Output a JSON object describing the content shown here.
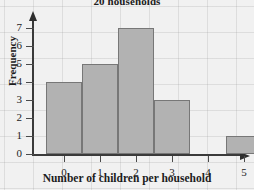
{
  "chart_data": {
    "type": "bar",
    "title": "20 households",
    "xlabel": "Number of children per household",
    "ylabel": "Frequency",
    "categories": [
      "0",
      "1",
      "2",
      "3",
      "4",
      "5"
    ],
    "values": [
      4,
      5,
      7,
      3,
      0,
      1
    ],
    "ylim": [
      0,
      7.8
    ],
    "yticks": [
      0,
      1,
      2,
      3,
      4,
      5,
      6,
      7
    ],
    "ytick_labels": [
      "0",
      "1",
      "2",
      "3",
      "4",
      "5",
      "6",
      "7"
    ],
    "xtick_labels": [
      "0",
      "1",
      "2",
      "3",
      "4",
      "5"
    ],
    "grid": true,
    "legend": false,
    "bar_fill_color": "#b2b2b2",
    "bar_edge_color": "#777777",
    "axis_color": "#3a3a3a",
    "background_color": "#f1f1f1"
  }
}
